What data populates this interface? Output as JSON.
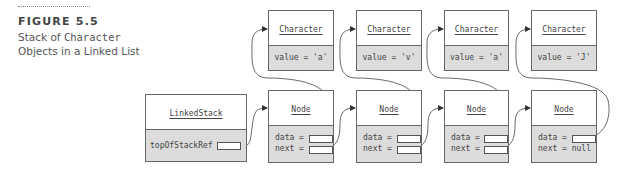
{
  "caption": {
    "figure_label": "FIGURE 5.5",
    "line1_prefix": "Stack of ",
    "line1_code": "Character",
    "line2": "Objects in a Linked List"
  },
  "linked_stack": {
    "class_name": "LinkedStack",
    "field": "topOfStackRef ="
  },
  "characters": [
    {
      "class_name": "Character",
      "field": "value = 'a'"
    },
    {
      "class_name": "Character",
      "field": "value = 'v'"
    },
    {
      "class_name": "Character",
      "field": "value = 'a'"
    },
    {
      "class_name": "Character",
      "field": "value = 'J'"
    }
  ],
  "nodes": [
    {
      "class_name": "Node",
      "data_label": "data =",
      "next_label": "next ="
    },
    {
      "class_name": "Node",
      "data_label": "data =",
      "next_label": "next ="
    },
    {
      "class_name": "Node",
      "data_label": "data =",
      "next_label": "next ="
    },
    {
      "class_name": "Node",
      "data_label": "data =",
      "next_label": "next = null"
    }
  ],
  "colors": {
    "fill_gray": "#dcdcdc",
    "border": "#666666",
    "text": "#444444"
  }
}
